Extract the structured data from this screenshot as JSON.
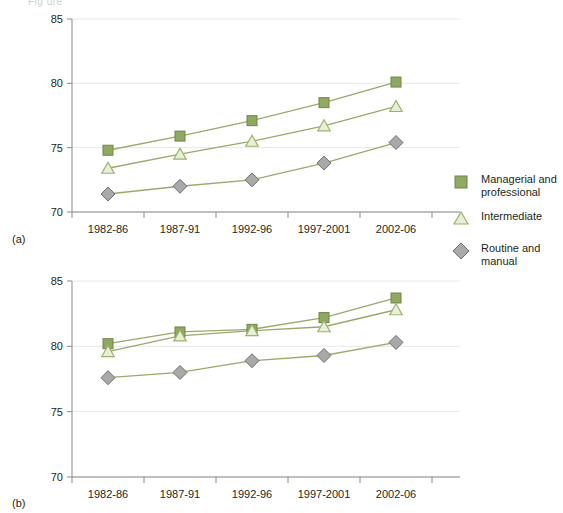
{
  "figure": {
    "panel_a_label": "(a)",
    "panel_b_label": "(b)",
    "clipped_header": "Fig ure"
  },
  "legend": {
    "position": "right",
    "items": [
      {
        "key": "managerial",
        "label_line1": "Managerial and",
        "label_line2": "professional",
        "marker": "square-marker-icon",
        "color": "#8fa862"
      },
      {
        "key": "intermediate",
        "label_line1": "Intermediate",
        "label_line2": "",
        "marker": "triangle-marker-icon",
        "color": "#e7f0d6"
      },
      {
        "key": "routine",
        "label_line1": "Routine and",
        "label_line2": "manual",
        "marker": "diamond-marker-icon",
        "color": "#a9a9a9"
      }
    ]
  },
  "colors": {
    "managerial_fill": "#8fa862",
    "managerial_stroke": "#6f8548",
    "intermediate_fill": "#e7f0d6",
    "intermediate_stroke": "#9cb26c",
    "routine_fill": "#a9a9a9",
    "routine_stroke": "#6e6e6e",
    "line": "#9aa86a",
    "grid": "#e8e8e8",
    "axis": "#8a8a8a"
  },
  "chart_data": [
    {
      "id": "panel-a",
      "type": "line",
      "title": "",
      "subtitle": "(a)",
      "xlabel": "",
      "ylabel": "",
      "categories": [
        "1982-86",
        "1987-91",
        "1992-96",
        "1997-2001",
        "2002-06"
      ],
      "yticks": [
        70,
        75,
        80,
        85
      ],
      "ylim": [
        70,
        85
      ],
      "grid": true,
      "legend": "right",
      "series": [
        {
          "name": "Managerial and professional",
          "marker": "square",
          "values": [
            74.8,
            75.9,
            77.1,
            78.5,
            80.1
          ]
        },
        {
          "name": "Intermediate",
          "marker": "triangle",
          "values": [
            73.4,
            74.5,
            75.5,
            76.7,
            78.2
          ]
        },
        {
          "name": "Routine and manual",
          "marker": "diamond",
          "values": [
            71.4,
            72.0,
            72.5,
            73.8,
            75.4
          ]
        }
      ]
    },
    {
      "id": "panel-b",
      "type": "line",
      "title": "",
      "subtitle": "(b)",
      "xlabel": "",
      "ylabel": "",
      "categories": [
        "1982-86",
        "1987-91",
        "1992-96",
        "1997-2001",
        "2002-06"
      ],
      "yticks": [
        70,
        75,
        80,
        85
      ],
      "ylim": [
        70,
        85
      ],
      "grid": true,
      "legend": "none",
      "series": [
        {
          "name": "Managerial and professional",
          "marker": "square",
          "values": [
            80.2,
            81.1,
            81.3,
            82.2,
            83.7
          ]
        },
        {
          "name": "Intermediate",
          "marker": "triangle",
          "values": [
            79.6,
            80.8,
            81.2,
            81.5,
            82.8
          ]
        },
        {
          "name": "Routine and manual",
          "marker": "diamond",
          "values": [
            77.6,
            78.0,
            78.9,
            79.3,
            80.3
          ]
        }
      ]
    }
  ]
}
